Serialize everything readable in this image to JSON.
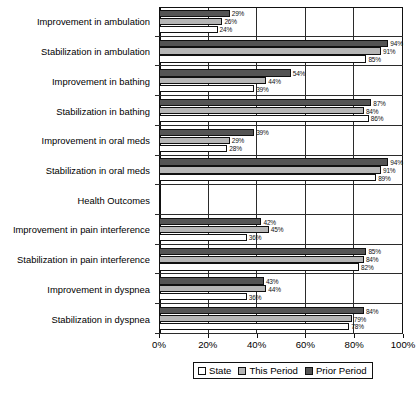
{
  "chart_data": {
    "type": "bar",
    "orientation": "horizontal",
    "title": "",
    "xlabel": "",
    "ylabel": "Health Outcomes",
    "xlim": [
      0,
      100
    ],
    "xticks": [
      "0%",
      "20%",
      "40%",
      "60%",
      "80%",
      "100%"
    ],
    "xtick_values": [
      0,
      20,
      40,
      60,
      80,
      100
    ],
    "grid": true,
    "legend_position": "bottom",
    "categories": [
      "Improvement in ambulation",
      "Stabilization in ambulation",
      "Improvement in bathing",
      "Stabilization in bathing",
      "Improvement in oral meds",
      "Stabilization in oral meds",
      "Health Outcomes",
      "Improvement in pain interference",
      "Stabilization in pain interference",
      "Improvement in dyspnea",
      "Stabilization in dyspnea"
    ],
    "series": [
      {
        "name": "State",
        "color": "#ffffff",
        "values": [
          24,
          85,
          39,
          86,
          28,
          89,
          null,
          36,
          82,
          36,
          78
        ],
        "labels": [
          "24%",
          "85%",
          "39%",
          "86%",
          "28%",
          "89%",
          "",
          "36%",
          "82%",
          "36%",
          "78%"
        ]
      },
      {
        "name": "This Period",
        "color": "#b6b6b6",
        "values": [
          26,
          91,
          44,
          84,
          29,
          91,
          null,
          45,
          84,
          44,
          79
        ],
        "labels": [
          "26%",
          "91%",
          "44%",
          "84%",
          "29%",
          "91%",
          "",
          "45%",
          "84%",
          "44%",
          "79%"
        ]
      },
      {
        "name": "Prior Period",
        "color": "#545454",
        "values": [
          29,
          94,
          54,
          87,
          39,
          94,
          null,
          42,
          85,
          43,
          84
        ],
        "labels": [
          "29%",
          "94%",
          "54%",
          "87%",
          "39%",
          "94%",
          "",
          "42%",
          "85%",
          "43%",
          "84%"
        ]
      }
    ]
  },
  "legend": {
    "items": [
      {
        "label": "State"
      },
      {
        "label": "This Period"
      },
      {
        "label": "Prior Period"
      }
    ]
  }
}
